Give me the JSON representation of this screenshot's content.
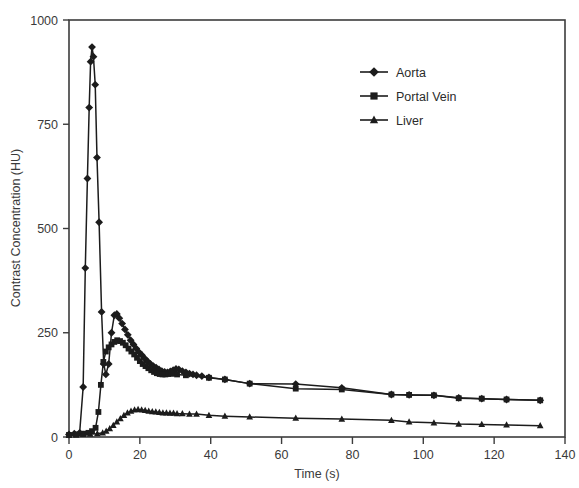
{
  "chart_data": {
    "type": "line",
    "title": "",
    "xlabel": "Time (s)",
    "ylabel": "Contrast Concentration (HU)",
    "xlim": [
      0,
      140
    ],
    "ylim": [
      0,
      1000
    ],
    "xticks": [
      0,
      20,
      40,
      60,
      80,
      100,
      120,
      140
    ],
    "yticks": [
      0,
      250,
      500,
      750,
      1000
    ],
    "grid": false,
    "legend_position": "upper-center-right",
    "series": [
      {
        "name": "Aorta",
        "marker": "diamond",
        "color": "#1c1c1c",
        "points": [
          [
            0,
            6
          ],
          [
            1.5,
            8
          ],
          [
            3,
            10
          ],
          [
            4,
            120
          ],
          [
            4.6,
            405
          ],
          [
            5.2,
            620
          ],
          [
            5.7,
            790
          ],
          [
            6.1,
            900
          ],
          [
            6.5,
            935
          ],
          [
            6.9,
            912
          ],
          [
            7.4,
            845
          ],
          [
            7.9,
            670
          ],
          [
            8.5,
            515
          ],
          [
            9.2,
            300
          ],
          [
            9.8,
            175
          ],
          [
            10.4,
            150
          ],
          [
            11.2,
            175
          ],
          [
            12.0,
            250
          ],
          [
            12.8,
            292
          ],
          [
            13.5,
            295
          ],
          [
            14.2,
            285
          ],
          [
            15.0,
            272
          ],
          [
            15.8,
            258
          ],
          [
            16.6,
            245
          ],
          [
            17.4,
            232
          ],
          [
            18.2,
            222
          ],
          [
            19.0,
            212
          ],
          [
            19.8,
            203
          ],
          [
            20.6,
            196
          ],
          [
            21.4,
            188
          ],
          [
            22.2,
            181
          ],
          [
            23.0,
            175
          ],
          [
            23.8,
            170
          ],
          [
            24.6,
            166
          ],
          [
            25.4,
            162
          ],
          [
            26.2,
            158
          ],
          [
            27.0,
            156
          ],
          [
            27.8,
            155
          ],
          [
            28.6,
            157
          ],
          [
            29.4,
            160
          ],
          [
            30.2,
            163
          ],
          [
            31.0,
            162
          ],
          [
            32.0,
            158
          ],
          [
            33.0,
            155
          ],
          [
            34.0,
            152
          ],
          [
            35.0,
            150
          ],
          [
            36.0,
            148
          ],
          [
            37.5,
            146
          ],
          [
            39.5,
            143
          ],
          [
            44.0,
            138
          ],
          [
            51.0,
            128
          ],
          [
            64.0,
            127
          ],
          [
            77.0,
            118
          ],
          [
            91.0,
            102
          ],
          [
            96.0,
            101
          ],
          [
            103.0,
            100
          ],
          [
            110.0,
            94
          ],
          [
            116.5,
            92
          ],
          [
            123.5,
            90
          ],
          [
            133.0,
            88
          ]
        ]
      },
      {
        "name": "Portal Vein",
        "marker": "square",
        "color": "#1c1c1c",
        "points": [
          [
            0,
            5
          ],
          [
            2,
            6
          ],
          [
            4,
            8
          ],
          [
            5.5,
            10
          ],
          [
            6.5,
            14
          ],
          [
            7.5,
            22
          ],
          [
            8.3,
            60
          ],
          [
            9.0,
            125
          ],
          [
            9.7,
            180
          ],
          [
            10.4,
            205
          ],
          [
            11.2,
            215
          ],
          [
            12.0,
            222
          ],
          [
            12.8,
            228
          ],
          [
            13.6,
            232
          ],
          [
            14.4,
            230
          ],
          [
            15.2,
            226
          ],
          [
            16.0,
            220
          ],
          [
            16.8,
            212
          ],
          [
            17.6,
            205
          ],
          [
            18.4,
            198
          ],
          [
            19.2,
            190
          ],
          [
            20.0,
            182
          ],
          [
            20.8,
            175
          ],
          [
            21.6,
            170
          ],
          [
            22.4,
            165
          ],
          [
            23.2,
            160
          ],
          [
            24.0,
            156
          ],
          [
            24.8,
            153
          ],
          [
            25.6,
            151
          ],
          [
            26.4,
            150
          ],
          [
            27.2,
            150
          ],
          [
            28.0,
            151
          ],
          [
            28.8,
            152
          ],
          [
            29.6,
            152
          ],
          [
            30.5,
            150
          ],
          [
            33.0,
            148
          ],
          [
            39.5,
            142
          ],
          [
            44.0,
            138
          ],
          [
            51.0,
            128
          ],
          [
            64.0,
            116
          ],
          [
            77.0,
            114
          ],
          [
            91.0,
            102
          ],
          [
            96.0,
            101
          ],
          [
            103.0,
            100
          ],
          [
            110.0,
            93
          ],
          [
            116.5,
            92
          ],
          [
            123.5,
            90
          ],
          [
            133.0,
            88
          ]
        ]
      },
      {
        "name": "Liver",
        "marker": "triangle",
        "color": "#1c1c1c",
        "points": [
          [
            0,
            4
          ],
          [
            2,
            5
          ],
          [
            4,
            6
          ],
          [
            6,
            7
          ],
          [
            8,
            8
          ],
          [
            9.5,
            10
          ],
          [
            10.5,
            14
          ],
          [
            11.5,
            20
          ],
          [
            12.5,
            28
          ],
          [
            13.5,
            36
          ],
          [
            14.5,
            44
          ],
          [
            15.5,
            52
          ],
          [
            16.5,
            58
          ],
          [
            17.5,
            62
          ],
          [
            18.5,
            65
          ],
          [
            19.5,
            66
          ],
          [
            20.5,
            65
          ],
          [
            21.5,
            64
          ],
          [
            22.5,
            62
          ],
          [
            23.5,
            61
          ],
          [
            24.5,
            60
          ],
          [
            25.5,
            59
          ],
          [
            26.5,
            58
          ],
          [
            27.5,
            58
          ],
          [
            28.5,
            57
          ],
          [
            29.5,
            57
          ],
          [
            30.5,
            56
          ],
          [
            32.0,
            56
          ],
          [
            34.0,
            55
          ],
          [
            36.0,
            55
          ],
          [
            39.5,
            52
          ],
          [
            44.0,
            50
          ],
          [
            51.0,
            48
          ],
          [
            64.0,
            45
          ],
          [
            77.0,
            43
          ],
          [
            91.0,
            40
          ],
          [
            96.0,
            36
          ],
          [
            103.0,
            34
          ],
          [
            110.0,
            31
          ],
          [
            116.5,
            30
          ],
          [
            123.5,
            29
          ],
          [
            133.0,
            27
          ]
        ]
      }
    ],
    "legend_entries": [
      {
        "label": "Aorta",
        "marker": "diamond"
      },
      {
        "label": "Portal Vein",
        "marker": "square"
      },
      {
        "label": "Liver",
        "marker": "triangle"
      }
    ]
  }
}
